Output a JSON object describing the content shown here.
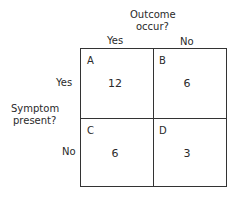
{
  "column_header": {
    "title_line1": "Outcome",
    "title_line2": "occur?",
    "yes": "Yes",
    "no": "No"
  },
  "row_header": {
    "title_line1": "Symptom",
    "title_line2": "present?",
    "yes": "Yes",
    "no": "No"
  },
  "cells": {
    "A": {
      "label": "A",
      "value": "12"
    },
    "B": {
      "label": "B",
      "value": "6"
    },
    "C": {
      "label": "C",
      "value": "6"
    },
    "D": {
      "label": "D",
      "value": "3"
    }
  }
}
